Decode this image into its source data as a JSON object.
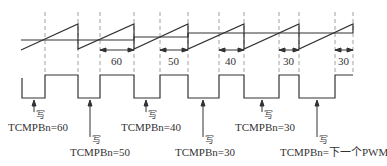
{
  "diagram": {
    "type": "pwm-timing",
    "colors": {
      "line": "#333333",
      "dash": "#888888"
    },
    "dead_zone_labels": [
      "60",
      "50",
      "40",
      "30",
      "30"
    ],
    "write_label": "写",
    "annotations": [
      {
        "text": "TCMPBn=60"
      },
      {
        "text": "TCMPBn=50"
      },
      {
        "text": "TCMPBn=40"
      },
      {
        "text": "TCMPBn=30"
      },
      {
        "text": "TCMPBn=30"
      },
      {
        "text": "TCMPBn=下一个PWM"
      }
    ]
  }
}
